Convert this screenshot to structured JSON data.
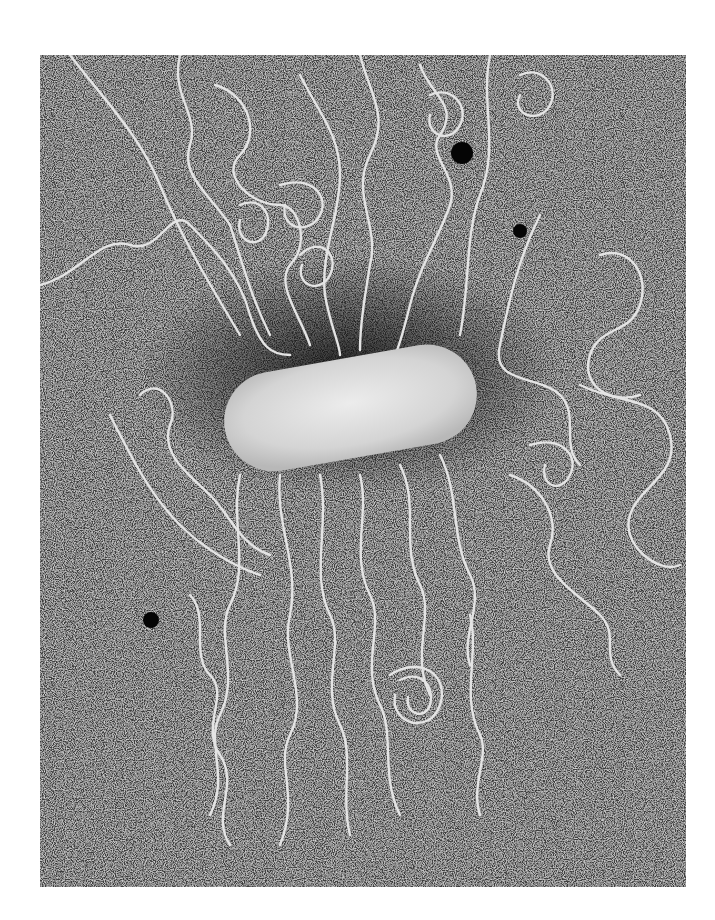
{
  "image": {
    "kind": "electron-micrograph",
    "subject": "bacterial cell with extruded DNA loops",
    "colors": {
      "background": "#ffffff",
      "field": "#5a5a5a",
      "strand": "#e6e6e6",
      "cell_body": "#dcdcdc",
      "particle": "#0a0a0a"
    }
  }
}
